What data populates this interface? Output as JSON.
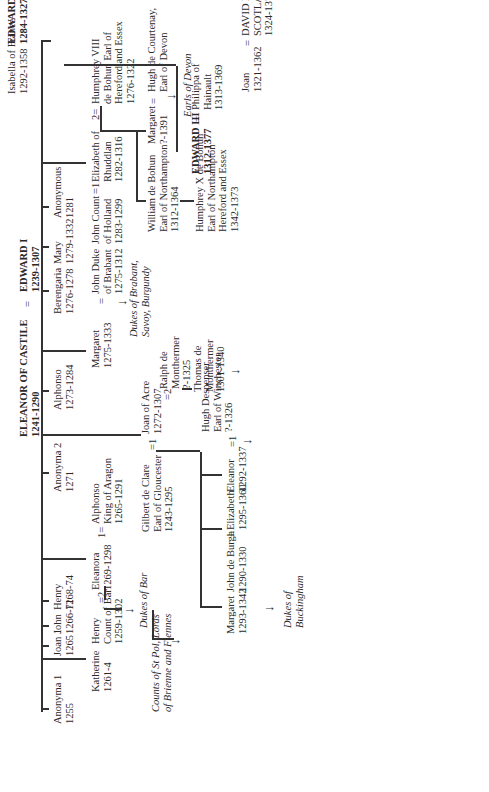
{
  "root": {
    "father": {
      "name": "EDWARD I",
      "dates": "1239-1307"
    },
    "mother": {
      "name": "ELEANOR OF CASTILE",
      "dates": "1241-1290"
    },
    "marriage_symbol": "="
  },
  "children_gen1": [
    {
      "name": "Anonyma 1",
      "dates": "1255"
    },
    {
      "name": "Katherine",
      "dates": "1261-4"
    },
    {
      "name": "Joan 1",
      "dates": "1265"
    },
    {
      "name": "John",
      "dates": "1266-71"
    },
    {
      "name": "Henry",
      "dates": "1268-74"
    },
    {
      "name": "Eleanora",
      "dates": "1269-1298"
    },
    {
      "name": "Anonyma 2",
      "dates": "1271"
    },
    {
      "name": "Joan of Acre",
      "dates": "1272-1307"
    },
    {
      "name": "Alphonso",
      "dates": "1273-1284"
    },
    {
      "name": "Margaret",
      "dates": "1275-1333"
    },
    {
      "name": "Berengaria",
      "dates": "1276-1278"
    },
    {
      "name": "Mary",
      "dates": "1279-1332"
    },
    {
      "name": "Anonymous",
      "dates": "1281"
    },
    {
      "name": "Elizabeth of Rhuddlan",
      "dates": "1282-1316"
    },
    {
      "name": "EDWARD II",
      "dates": "1284-1327"
    }
  ],
  "spouses": {
    "henry_bar": {
      "lines": [
        "Henry",
        "Count of Bar",
        "1259-1302"
      ],
      "symbol": "=2"
    },
    "alphonso_aragon": {
      "lines": [
        "Alphonso",
        "King of Aragon",
        "1265-1291"
      ],
      "symbol": "1="
    },
    "gilbert_clare": {
      "lines": [
        "Gilbert de Clare",
        "Earl of Gloucester",
        "1243-1295"
      ],
      "symbol": "=1"
    },
    "ralph_monthermer": {
      "lines": [
        "Ralph de",
        "Monthermer",
        "?-1325"
      ],
      "symbol": "=2"
    },
    "john_brabant": {
      "lines": [
        "John Duke",
        "of Brabant",
        "1275-1312"
      ],
      "symbol": "="
    },
    "john_holland": {
      "lines": [
        "John Count",
        "of Holland",
        "1283-1299"
      ],
      "symbol": "=1"
    },
    "humphrey_viii": {
      "lines": [
        "Humphrey VIII",
        "de Bohun Earl of",
        "Hereford and Essex",
        "1276-1322"
      ],
      "symbol": "2="
    },
    "isabella_france": {
      "lines": [
        "Isabella of France",
        "1292-1358"
      ],
      "symbol": "="
    }
  },
  "gen2": {
    "margaret_clare": {
      "lines": [
        "Margaret",
        "1293-1342"
      ]
    },
    "elizabeth_clare": {
      "lines": [
        "Elizabeth",
        "1295-1360"
      ]
    },
    "john_de_burgh": {
      "lines": [
        "John de Burgh",
        "1290-1330"
      ],
      "symbol": "="
    },
    "eleanor_clare": {
      "lines": [
        "Eleanor",
        "1292-1337"
      ]
    },
    "hugh_despenser": {
      "lines": [
        "Hugh Despenser",
        "Earl of Winchester",
        "?-1326"
      ],
      "symbol": "=1"
    },
    "thomas_monthermer": {
      "lines": [
        "Thomas de",
        "Monthermer",
        "1301-1340"
      ]
    },
    "william_bohun": {
      "lines": [
        "William de Bohun",
        "Earl of Northampton",
        "1312-1364"
      ]
    },
    "margaret_bohun": {
      "lines": [
        "Margaret",
        "?-1391"
      ]
    },
    "hugh_courtenay": {
      "lines": [
        "Hugh de Courtenay,",
        "Earl of Devon"
      ],
      "symbol": "="
    },
    "edward_iii": {
      "lines": [
        "EDWARD III",
        "1312-1377"
      ]
    },
    "philippa_hainault": {
      "lines": [
        "Philippa of",
        "Hainault",
        "1313-1369"
      ],
      "symbol": "="
    },
    "joan_1321": {
      "lines": [
        "Joan",
        "1321-1362"
      ]
    },
    "david_ii": {
      "lines": [
        "DAVID II of",
        "SCOTLAND",
        "1324-1371"
      ],
      "symbol": "="
    },
    "robert_bruce": {
      "lines": [
        "Robert I",
        "The Bruce",
        "1274-1329"
      ]
    },
    "elizabeth_burgh_1327": {
      "lines": [
        "Elizabeth",
        "de Burgh",
        "?-1327"
      ],
      "symbol": "="
    }
  },
  "gen3": {
    "anne_beauchamp": {
      "lines": [
        "Anne Beauchamp",
        "Countess of Warwick",
        "1426-1492"
      ]
    },
    "richard_neville": {
      "lines": [
        "Richard Neville Earl",
        "of Salisbury (\"Warwick",
        "the Kingmaker\") 1428-1471"
      ],
      "symbol": "="
    },
    "humphrey_x": {
      "lines": [
        "Humphrey X de Bohun",
        "Earl of Northampton",
        "Hereford and Essex",
        "1342-1373"
      ]
    },
    "black_prince": {
      "lines": [
        "Edward of Woodstock",
        "\"The Black Prince\"",
        "1330-1376"
      ]
    },
    "joan_kent": {
      "lines": [
        "Joan Countess",
        "of Kent",
        "1328-1385"
      ],
      "symbol": "="
    },
    "elizabeth_burgh_ulster": {
      "lines": [
        "Elizabeth de Burgh",
        "Countess of Ulster",
        "1332-1363"
      ]
    },
    "lionel": {
      "lines": [
        "Lionel Duke",
        "of Clarence",
        "1338-1368"
      ],
      "symbol": "="
    },
    "john_of_gaunt": {
      "lines": [
        "John of Gaunt",
        "Duke of Lancaster",
        "1340-1399"
      ]
    },
    "edmund_langley": {
      "lines": [
        "Edmund of Langley",
        "Duke of York",
        "1341-1402"
      ]
    },
    "thomas_woodstock": {
      "lines": [
        "Thomas of Woodstock",
        "Duke of Gloucester",
        "1356-1397"
      ]
    },
    "eleanor_bohun": {
      "lines": [
        "Eleanor de Bohun",
        "1366-1399"
      ],
      "symbol": "="
    },
    "mary_bohun": {
      "lines": [
        "Mary de Bohun",
        "1369-1394"
      ]
    },
    "henry_bolingbroke": {
      "lines": [
        "Henry of Bolingbroke",
        "Earl of Derby",
        "(HENRY IV)",
        "1367-1413"
      ],
      "symbol": "="
    }
  },
  "gen4": {
    "richard_ii": {
      "lines": [
        "RICHARD II",
        "1367-1400"
      ]
    },
    "edmund_mortimer": {
      "lines": [
        "Edmund Mortimer",
        "Earl of March",
        "1352-1381"
      ]
    },
    "philippa_ulster": {
      "lines": [
        "Philippa Countess",
        "of Ulster 1355-1378?"
      ],
      "symbol": "="
    },
    "henry_percy": {
      "lines": [
        "Sir Henry Percy",
        "\"Hotspur\"",
        "1320-1368"
      ]
    },
    "elizabeth_mortimer": {
      "lines": [
        "Elizabeth",
        "1371-1417"
      ],
      "symbol": "="
    },
    "roger_mortimer": {
      "lines": [
        "Roger Mortimer",
        "Earl of March",
        "1374-1398"
      ]
    }
  },
  "lineage_notes": {
    "counts_st_pol": [
      "Counts of St Pol, Lords",
      "of Brienne and Fiennes"
    ],
    "dukes_of_bar": [
      "Dukes of Bar"
    ],
    "dukes_buckingham_1": [
      "Dukes of",
      "Buckingham"
    ],
    "dukes_brabant": [
      "Dukes of Brabant,",
      "Savoy, Burgundy"
    ],
    "earls_devon": [
      "Earls of Devon"
    ],
    "earls_northumberland": [
      "Earls/Dukes of",
      "Northumberland"
    ],
    "beauforts": [
      "Beauforts"
    ],
    "dukes_buckingham_2": [
      "Dukes of",
      "Buckingham"
    ]
  },
  "dynasties": {
    "york_1": "YORK",
    "york_2": "YORK",
    "tudors": "TUDORS",
    "lancaster": "LANCASTER"
  }
}
